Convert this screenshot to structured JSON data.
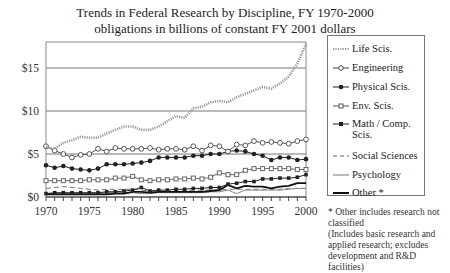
{
  "title": {
    "line1": "Trends in Federal Research by Discipline, FY 1970-2000",
    "line2": "obligations in billions of constant FY 2001 dollars"
  },
  "legend": {
    "items": [
      {
        "label": "Life Scis.",
        "style": "dotted"
      },
      {
        "label": "Engineering",
        "style": "open-circle"
      },
      {
        "label": "Physical Scis.",
        "style": "filled-circle"
      },
      {
        "label": "Env. Scis.",
        "style": "open-square"
      },
      {
        "label": "Math / Comp. Scis.",
        "style": "filled-square"
      },
      {
        "label": "Social Sciences",
        "style": "dashed"
      },
      {
        "label": "Psychology",
        "style": "thin-solid"
      },
      {
        "label": "Other *",
        "style": "thick-solid"
      }
    ]
  },
  "footnote": {
    "line1": "* Other includes research not classified",
    "line2": "(Includes basic research and applied research; excludes development and R&D facilities)"
  },
  "chart_data": {
    "type": "line",
    "title": "Trends in Federal Research by Discipline, FY 1970-2000",
    "subtitle": "obligations in billions of constant FY 2001 dollars",
    "xlabel": "",
    "ylabel": "",
    "x": [
      1970,
      1971,
      1972,
      1973,
      1974,
      1975,
      1976,
      1977,
      1978,
      1979,
      1980,
      1981,
      1982,
      1983,
      1984,
      1985,
      1986,
      1987,
      1988,
      1989,
      1990,
      1991,
      1992,
      1993,
      1994,
      1995,
      1996,
      1997,
      1998,
      1999,
      2000
    ],
    "xticks": [
      "1970",
      "1975",
      "1980",
      "1985",
      "1990",
      "1995",
      "2000"
    ],
    "yticks": [
      "$0",
      "$5",
      "$10",
      "$15"
    ],
    "ylim": [
      0,
      18
    ],
    "xlim": [
      1970,
      2000
    ],
    "grid": "horizontal at 5, 10, 15",
    "legend_position": "right",
    "series": [
      {
        "name": "Life Scis.",
        "values": [
          5.8,
          5.6,
          6.3,
          6.6,
          7.0,
          6.9,
          6.9,
          7.4,
          7.8,
          8.2,
          8.2,
          7.8,
          7.8,
          8.2,
          8.8,
          9.4,
          9.2,
          10.3,
          10.5,
          11.0,
          11.2,
          11.0,
          11.6,
          12.0,
          12.4,
          12.8,
          12.6,
          13.2,
          14.0,
          15.5,
          17.8
        ]
      },
      {
        "name": "Engineering",
        "values": [
          5.9,
          5.4,
          5.0,
          4.6,
          4.9,
          5.0,
          5.6,
          5.3,
          5.7,
          5.6,
          5.6,
          5.6,
          5.7,
          5.5,
          5.6,
          5.6,
          5.5,
          5.9,
          5.4,
          6.0,
          5.9,
          5.3,
          6.1,
          6.0,
          6.5,
          6.3,
          6.4,
          6.3,
          6.2,
          6.5,
          6.7
        ]
      },
      {
        "name": "Physical Scis.",
        "values": [
          3.7,
          3.4,
          3.6,
          3.3,
          3.2,
          3.1,
          3.3,
          3.8,
          3.8,
          3.8,
          3.9,
          4.0,
          4.2,
          4.6,
          4.6,
          4.6,
          4.6,
          4.8,
          4.8,
          5.0,
          5.0,
          5.3,
          5.4,
          5.3,
          5.0,
          4.8,
          4.3,
          4.6,
          4.6,
          4.3,
          4.4
        ]
      },
      {
        "name": "Env. Scis.",
        "values": [
          1.9,
          1.9,
          1.9,
          1.9,
          1.9,
          2.0,
          2.0,
          2.0,
          2.2,
          2.2,
          2.4,
          2.0,
          1.9,
          2.0,
          2.0,
          2.1,
          2.1,
          2.2,
          2.1,
          2.3,
          2.8,
          2.6,
          2.6,
          3.1,
          3.3,
          3.3,
          3.3,
          3.3,
          3.3,
          3.2,
          3.2
        ]
      },
      {
        "name": "Math / Comp. Scis.",
        "values": [
          0.4,
          0.5,
          0.5,
          0.5,
          0.5,
          0.5,
          0.5,
          0.6,
          0.6,
          0.7,
          0.8,
          1.1,
          0.7,
          0.8,
          0.8,
          0.9,
          0.9,
          1.0,
          1.0,
          1.1,
          1.1,
          1.5,
          1.6,
          1.8,
          1.8,
          2.1,
          2.1,
          2.2,
          2.2,
          2.3,
          2.6
        ]
      },
      {
        "name": "Social Sciences",
        "values": [
          1.0,
          1.1,
          1.2,
          1.1,
          1.0,
          0.9,
          0.8,
          0.9,
          0.9,
          0.9,
          0.9,
          0.8,
          0.7,
          0.7,
          0.7,
          0.7,
          0.7,
          0.8,
          0.8,
          0.8,
          0.8,
          0.9,
          0.9,
          0.9,
          0.9,
          0.9,
          0.9,
          0.9,
          1.0,
          1.0,
          1.0
        ]
      },
      {
        "name": "Psychology",
        "values": [
          0.4,
          0.4,
          0.4,
          0.4,
          0.4,
          0.4,
          0.4,
          0.5,
          0.5,
          0.5,
          0.5,
          0.4,
          0.4,
          0.5,
          0.5,
          0.5,
          0.5,
          0.5,
          0.5,
          0.6,
          0.6,
          0.8,
          0.4,
          0.8,
          0.8,
          0.8,
          0.8,
          0.8,
          0.9,
          1.0,
          1.0
        ]
      },
      {
        "name": "Other *",
        "values": [
          0.3,
          0.3,
          0.3,
          0.3,
          0.3,
          0.3,
          0.3,
          0.3,
          0.4,
          0.4,
          0.6,
          0.6,
          0.5,
          0.6,
          0.6,
          0.6,
          0.6,
          0.6,
          0.6,
          0.7,
          0.8,
          1.4,
          1.0,
          1.3,
          1.2,
          1.2,
          1.0,
          1.2,
          1.3,
          1.6,
          1.6
        ]
      }
    ]
  }
}
